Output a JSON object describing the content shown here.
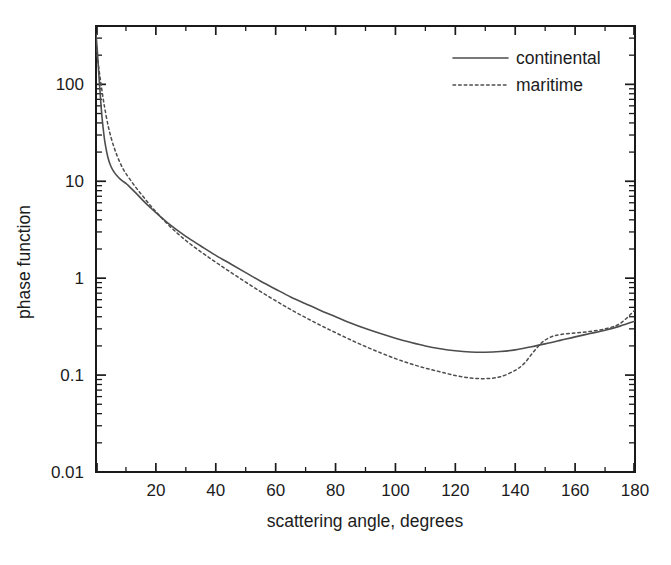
{
  "chart_data": {
    "type": "line",
    "title": "",
    "xlabel": "scattering angle, degrees",
    "ylabel": "phase function",
    "xlim": [
      0,
      180
    ],
    "ylim": [
      0.01,
      400
    ],
    "yscale": "log",
    "xscale": "linear",
    "grid": false,
    "legend_position": "top-right",
    "x_ticks": [
      0,
      20,
      40,
      60,
      80,
      100,
      120,
      140,
      160,
      180
    ],
    "x_tick_labels": [
      "",
      "20",
      "40",
      "60",
      "80",
      "100",
      "120",
      "140",
      "160",
      "180"
    ],
    "x_minor_ticks": [
      10,
      30,
      50,
      70,
      90,
      110,
      130,
      150,
      170
    ],
    "y_ticks": [
      0.01,
      0.1,
      1,
      10,
      100
    ],
    "y_tick_labels": [
      "0.01",
      "0.1",
      "1",
      "10",
      "100"
    ],
    "series": [
      {
        "name": "continental",
        "style": "solid",
        "color": "#4d4d4d",
        "x": [
          0,
          0.5,
          1,
          1.5,
          2,
          2.5,
          3,
          4,
          5,
          6,
          7,
          8,
          9,
          10,
          12,
          14,
          16,
          18,
          20,
          25,
          30,
          35,
          40,
          45,
          50,
          55,
          60,
          65,
          70,
          75,
          80,
          85,
          90,
          95,
          100,
          105,
          110,
          115,
          120,
          125,
          130,
          135,
          140,
          145,
          150,
          155,
          160,
          165,
          170,
          175,
          180
        ],
        "y": [
          330,
          210,
          120,
          72,
          46,
          33,
          25,
          17.5,
          14.2,
          12.5,
          11.4,
          10.6,
          10.0,
          9.5,
          8.3,
          7.2,
          6.2,
          5.4,
          4.75,
          3.5,
          2.7,
          2.15,
          1.72,
          1.4,
          1.14,
          0.93,
          0.77,
          0.64,
          0.545,
          0.465,
          0.4,
          0.345,
          0.302,
          0.268,
          0.24,
          0.218,
          0.2,
          0.187,
          0.178,
          0.173,
          0.172,
          0.175,
          0.182,
          0.195,
          0.21,
          0.228,
          0.248,
          0.268,
          0.29,
          0.32,
          0.36
        ]
      },
      {
        "name": "maritime",
        "style": "dotted",
        "color": "#4d4d4d",
        "x": [
          0,
          0.5,
          1,
          1.5,
          2,
          2.5,
          3,
          4,
          5,
          6,
          7,
          8,
          9,
          10,
          12,
          14,
          16,
          18,
          20,
          25,
          30,
          35,
          40,
          45,
          50,
          55,
          60,
          65,
          70,
          75,
          80,
          85,
          90,
          95,
          100,
          105,
          110,
          115,
          120,
          125,
          130,
          135,
          140,
          143,
          146,
          149,
          152,
          155,
          160,
          165,
          170,
          175,
          180
        ],
        "y": [
          230,
          185,
          142,
          110,
          86,
          68,
          55,
          38,
          28.5,
          22.5,
          18.5,
          15.6,
          13.5,
          12.0,
          9.8,
          8.1,
          6.8,
          5.7,
          4.85,
          3.35,
          2.45,
          1.87,
          1.46,
          1.15,
          0.91,
          0.725,
          0.585,
          0.475,
          0.392,
          0.326,
          0.274,
          0.231,
          0.197,
          0.17,
          0.148,
          0.131,
          0.118,
          0.108,
          0.099,
          0.0935,
          0.092,
          0.096,
          0.112,
          0.132,
          0.172,
          0.218,
          0.248,
          0.262,
          0.272,
          0.282,
          0.3,
          0.34,
          0.47
        ]
      }
    ],
    "annotations": []
  },
  "legend": {
    "entries": [
      {
        "label": "continental",
        "style": "solid"
      },
      {
        "label": "maritime",
        "style": "dotted"
      }
    ]
  },
  "axes": {
    "x_title": "scattering angle, degrees",
    "y_title": "phase function"
  }
}
